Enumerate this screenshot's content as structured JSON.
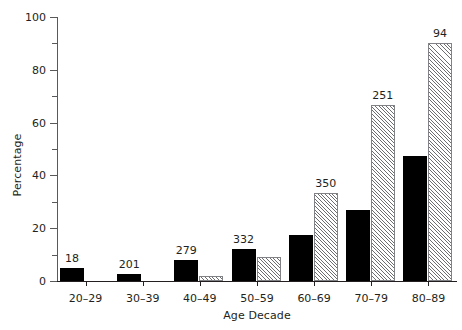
{
  "chart_data": {
    "type": "bar",
    "title": "",
    "xlabel": "Age Decade",
    "ylabel": "Percentage",
    "categories": [
      "20–29",
      "30–39",
      "40–49",
      "50–59",
      "60–69",
      "70–79",
      "80–89"
    ],
    "series": [
      {
        "name": "solid-black-series",
        "style": "solid-black",
        "values": [
          5,
          2.5,
          8,
          12,
          17.5,
          27,
          47.5
        ]
      },
      {
        "name": "hatched-series",
        "style": "diagonal-hatch",
        "values": [
          0,
          0,
          2,
          9,
          33.5,
          66.5,
          90
        ]
      }
    ],
    "group_annotations": [
      "18",
      "201",
      "279",
      "332",
      "350",
      "251",
      "94"
    ],
    "ylim": [
      0,
      100
    ],
    "ymajor_ticks": [
      0,
      20,
      40,
      60,
      80,
      100
    ],
    "yminor_ticks": [
      10,
      30,
      50,
      70,
      90
    ],
    "ytick_labels": [
      "0",
      "20",
      "40",
      "60",
      "80",
      "100"
    ],
    "grid": false,
    "legend": "none"
  },
  "colors": {
    "series_solid": "#000000",
    "series_hatch_line": "#6d6e71",
    "series_hatch_background": "#ffffff",
    "series_hatch_border": "#808285",
    "axis": "#231f20",
    "yaxis_line": "#58595b",
    "text": "#231f20",
    "background": "#ffffff"
  }
}
